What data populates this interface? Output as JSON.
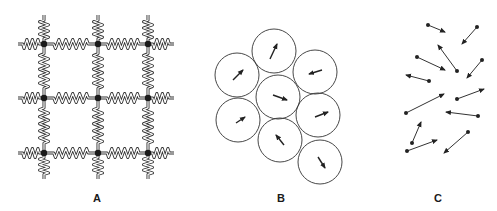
{
  "figure": {
    "width": 497,
    "height": 211,
    "line_color": "#333333",
    "node_color": "#1a1a1a",
    "panels": [
      {
        "id": "A",
        "label": "A",
        "label_pos": [
          97,
          192
        ],
        "description": "Square lattice of masses connected by springs",
        "grid": {
          "cols_x": [
            44,
            98,
            148
          ],
          "rows_y": [
            44,
            98,
            153
          ],
          "stub_length": 26,
          "node_radius": 3.2
        }
      },
      {
        "id": "B",
        "label": "B",
        "label_pos": [
          281,
          192
        ],
        "description": "Close-packed circles each containing a short arrow",
        "circle_radius": 22,
        "circles": [
          {
            "cx": 274,
            "cy": 51,
            "arrow": [
              270,
              59,
              277,
              44
            ]
          },
          {
            "cx": 237,
            "cy": 75,
            "arrow": [
              233,
              80,
              243,
              70
            ]
          },
          {
            "cx": 315,
            "cy": 72,
            "arrow": [
              322,
              70,
              309,
              74
            ]
          },
          {
            "cx": 278,
            "cy": 97,
            "arrow": [
              273,
              95,
              287,
              100
            ]
          },
          {
            "cx": 238,
            "cy": 120,
            "arrow": [
              236,
              123,
              245,
              117
            ]
          },
          {
            "cx": 318,
            "cy": 115,
            "arrow": [
              315,
              117,
              328,
              112
            ]
          },
          {
            "cx": 280,
            "cy": 140,
            "arrow": [
              284,
              145,
              276,
              135
            ]
          },
          {
            "cx": 320,
            "cy": 162,
            "arrow": [
              318,
              157,
              325,
              168
            ]
          }
        ]
      },
      {
        "id": "C",
        "label": "C",
        "label_pos": [
          438,
          192
        ],
        "description": "Scattered dots with arrows pointing in random directions",
        "arrows": [
          [
            428,
            25,
            445,
            32
          ],
          [
            477,
            27,
            462,
            44
          ],
          [
            457,
            71,
            438,
            45
          ],
          [
            417,
            57,
            445,
            70
          ],
          [
            482,
            60,
            467,
            78
          ],
          [
            429,
            81,
            406,
            75
          ],
          [
            406,
            113,
            444,
            94
          ],
          [
            457,
            99,
            484,
            89
          ],
          [
            478,
            116,
            446,
            112
          ],
          [
            412,
            143,
            421,
            122
          ],
          [
            407,
            151,
            437,
            140
          ],
          [
            468,
            132,
            444,
            153
          ]
        ]
      }
    ]
  }
}
